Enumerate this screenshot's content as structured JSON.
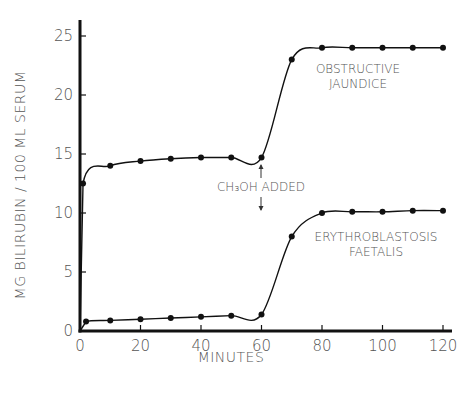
{
  "chart_data": {
    "type": "line",
    "title": "",
    "xlabel": "MINUTES",
    "ylabel": "MG BILIRUBIN / 100 ML SERUM",
    "xlim": [
      0,
      120
    ],
    "ylim": [
      0,
      25
    ],
    "x_ticks": [
      0,
      20,
      40,
      60,
      80,
      100,
      120
    ],
    "y_ticks": [
      0,
      5,
      10,
      15,
      20,
      25
    ],
    "grid": false,
    "series": [
      {
        "name": "OBSTRUCTIVE JAUNDICE",
        "label_lines": [
          "OBSTRUCTIVE",
          "JAUNDICE"
        ],
        "x": [
          0,
          1,
          10,
          20,
          30,
          40,
          50,
          60,
          70,
          80,
          90,
          100,
          110,
          120
        ],
        "y": [
          0,
          12.5,
          14.0,
          14.4,
          14.6,
          14.7,
          14.7,
          14.7,
          23.0,
          24.0,
          24.0,
          24.0,
          24.0,
          24.0
        ],
        "markers_from_index": 1
      },
      {
        "name": "ERYTHROBLASTOSIS FAETALIS",
        "label_lines": [
          "ERYTHROBLASTOSIS",
          "FAETALIS"
        ],
        "x": [
          0,
          2,
          10,
          20,
          30,
          40,
          50,
          60,
          70,
          80,
          90,
          100,
          110,
          120
        ],
        "y": [
          0,
          0.8,
          0.9,
          1.0,
          1.1,
          1.2,
          1.3,
          1.4,
          8.0,
          10.0,
          10.1,
          10.1,
          10.2,
          10.2
        ],
        "markers_from_index": 1
      }
    ],
    "annotations": [
      {
        "text": "CH3OH ADDED",
        "display": "CH₃OH ADDED",
        "x": 60,
        "arrows": "up and down"
      }
    ]
  },
  "labels": {
    "xlabel": "MINUTES",
    "ylabel": "MG BILIRUBIN / 100 ML SERUM",
    "annotation": "CH₃OH ADDED",
    "series0_l1": "OBSTRUCTIVE",
    "series0_l2": "JAUNDICE",
    "series1_l1": "ERYTHROBLASTOSIS",
    "series1_l2": "FAETALIS"
  }
}
